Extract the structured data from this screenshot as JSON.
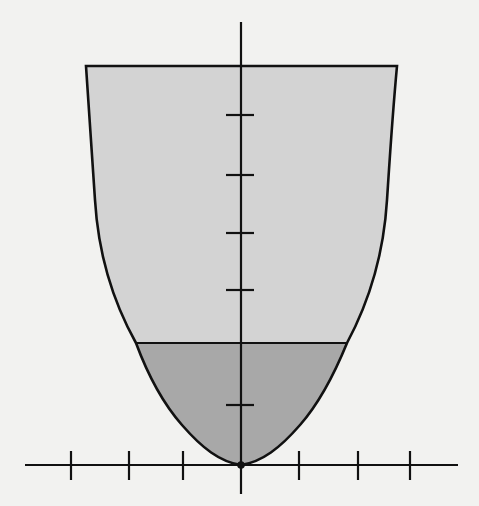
{
  "diagram": {
    "colors": {
      "background": "#f2f2f0",
      "upper_fill": "#d3d3d3",
      "lower_fill": "#a8a8a8",
      "stroke": "#111111"
    },
    "axes": {
      "origin": [
        241,
        465
      ],
      "x_axis": {
        "from": 25,
        "to": 458,
        "ticks_x": [
          71,
          129,
          183,
          299,
          358,
          410
        ]
      },
      "y_axis": {
        "from": 22,
        "to": 494,
        "ticks_y": [
          115,
          175,
          233,
          290,
          405
        ]
      }
    },
    "vessel": {
      "top_y": 66,
      "top_left_x": 86,
      "top_right_x": 397
    },
    "fill_level": {
      "y": 343,
      "left_x": 136,
      "right_x": 347
    }
  }
}
